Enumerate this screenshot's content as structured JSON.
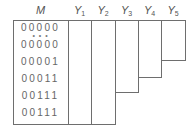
{
  "diagram": {
    "headers": {
      "m": "M",
      "y": [
        {
          "label": "Y",
          "sub": "1"
        },
        {
          "label": "Y",
          "sub": "2"
        },
        {
          "label": "Y",
          "sub": "3"
        },
        {
          "label": "Y",
          "sub": "4"
        },
        {
          "label": "Y",
          "sub": "5"
        }
      ]
    },
    "m_rows": [
      "00000",
      "00000",
      "00001",
      "00011",
      "00111",
      "00111"
    ],
    "ellipsis": "• • •",
    "line_color": "#6e6e6e"
  }
}
